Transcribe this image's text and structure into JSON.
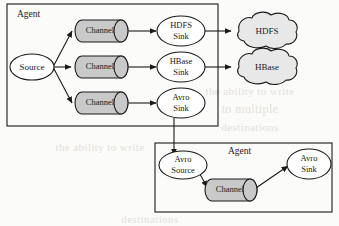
{
  "figure": {
    "type": "flow-diagram",
    "background_color": "#fbfbf9",
    "line_color": "#1a1a1a",
    "channel_fill": "#c9c9c9",
    "ellipse_fill": "#ffffff",
    "cloud_fill": "#e8e8e8"
  },
  "agents": [
    {
      "id": "agent-top",
      "label": "Agent",
      "source": {
        "label": "Source"
      },
      "channels": [
        {
          "label": "Channel"
        },
        {
          "label": "Channel"
        },
        {
          "label": "Channel"
        }
      ],
      "sinks": [
        {
          "label_line1": "HDFS",
          "label_line2": "Sink"
        },
        {
          "label_line1": "HBase",
          "label_line2": "Sink"
        },
        {
          "label_line1": "Avro",
          "label_line2": "Sink"
        }
      ]
    },
    {
      "id": "agent-bottom",
      "label": "Agent",
      "source": {
        "label_line1": "Avro",
        "label_line2": "Source"
      },
      "channels": [
        {
          "label": "Channel"
        }
      ],
      "sinks": [
        {
          "label_line1": "Avro",
          "label_line2": "Sink"
        }
      ]
    }
  ],
  "stores": [
    {
      "id": "store-hdfs",
      "label": "HDFS",
      "shape": "cloud"
    },
    {
      "id": "store-hbase",
      "label": "HBase",
      "shape": "cloud"
    }
  ],
  "connections": [
    {
      "from": "Source",
      "to": "Channel 1"
    },
    {
      "from": "Source",
      "to": "Channel 2"
    },
    {
      "from": "Source",
      "to": "Channel 3"
    },
    {
      "from": "Channel 1",
      "to": "HDFS Sink"
    },
    {
      "from": "Channel 2",
      "to": "HBase Sink"
    },
    {
      "from": "Channel 3",
      "to": "Avro Sink"
    },
    {
      "from": "HDFS Sink",
      "to": "HDFS"
    },
    {
      "from": "HBase Sink",
      "to": "HBase"
    },
    {
      "from": "Avro Sink",
      "to": "Avro Source"
    },
    {
      "from": "Avro Source",
      "to": "Channel"
    },
    {
      "from": "Channel",
      "to": "Avro Sink"
    }
  ],
  "watermark": {
    "visible": true,
    "note": "faint show-through text from reverse of scanned page",
    "lines": [
      "the ability to write",
      "to multiple",
      "destinations"
    ]
  }
}
